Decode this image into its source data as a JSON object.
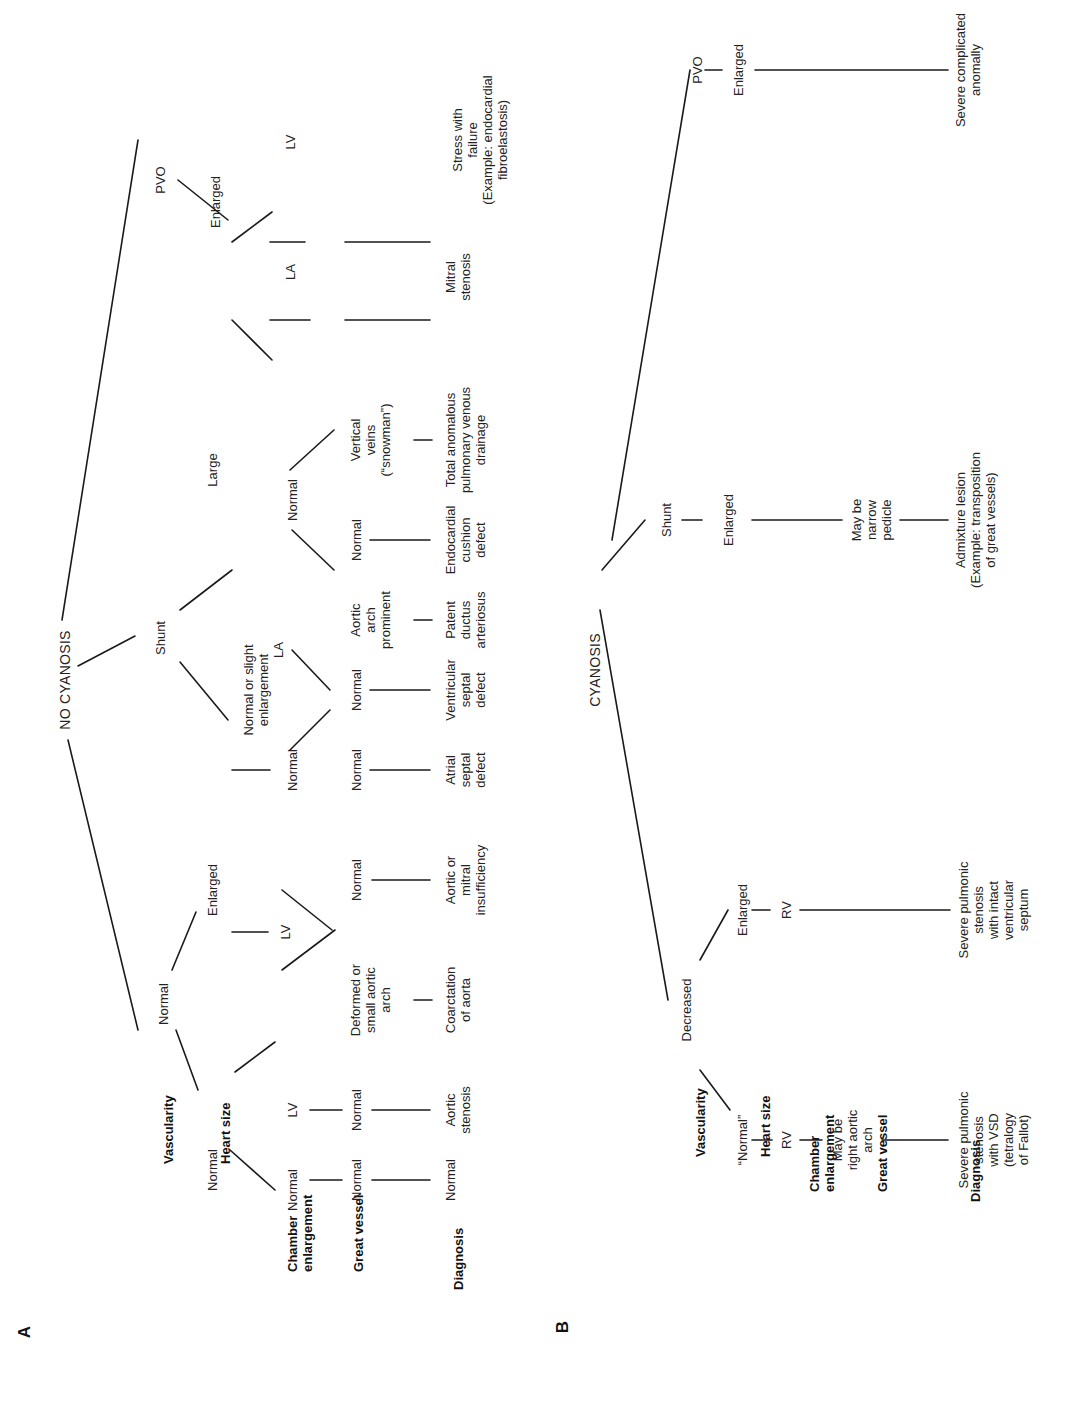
{
  "figure": {
    "panels": [
      {
        "id": "A",
        "letter": "A",
        "row_labels": [
          "Vascularity",
          "Heart size",
          "Chamber\nenlargement",
          "Great vessel",
          "Diagnosis"
        ],
        "root": "NO CYANOSIS",
        "vascularity": [
          "Normal",
          "Shunt",
          "PVO"
        ],
        "heart_size": [
          "Normal",
          "Enlarged",
          "Normal or slight\nenlargement",
          "Large",
          "Enlarged"
        ],
        "chamber": [
          "Normal",
          "LV",
          "LV",
          "Normal",
          "LA",
          "Normal",
          "LA",
          "LV"
        ],
        "great_vessel": [
          "Normal",
          "Normal",
          "Deformed or\nsmall aortic\narch",
          "Normal",
          "Normal",
          "Normal",
          "Aortic\narch\nprominent",
          "Normal",
          "Vertical\nveins\n(“snowman”)"
        ],
        "diagnosis": [
          "Normal",
          "Aortic\nstenosis",
          "Coarctation\nof aorta",
          "Aortic or\nmitral\ninsufficiency",
          "Atrial\nseptal\ndefect",
          "Ventricular\nseptal\ndefect",
          "Patent\nductus\narteriosus",
          "Endocardial\ncushion\ndefect",
          "Total anomalous\npulmonary venous\ndrainage",
          "Mitral\nstenosis",
          "Stress with\nfailure\n(Example: endocardial\nfibroelastosis)"
        ]
      },
      {
        "id": "B",
        "letter": "B",
        "row_labels": [
          "Vascularity",
          "Heart size",
          "Chamber\nenlargement",
          "Great vessel",
          "Diagnosis"
        ],
        "root": "CYANOSIS",
        "vascularity": [
          "Decreased",
          "Shunt",
          "PVO"
        ],
        "heart_size": [
          "“Normal”",
          "Enlarged",
          "Enlarged",
          "Enlarged"
        ],
        "chamber": [
          "RV",
          "RV"
        ],
        "great_vessel": [
          "May be\nright aortic\narch",
          "May be\nnarrow\npedicle"
        ],
        "diagnosis": [
          "Severe pulmonic\nstenosis\nwith VSD\n(tetralogy\nof Fallot)",
          "Severe pulmonic\nstenosis\nwith intact\nventricular\nseptum",
          "Admixture lesion\n(Example: transposition\nof great vessels)",
          "Severe complicated\nanomally"
        ]
      }
    ]
  }
}
